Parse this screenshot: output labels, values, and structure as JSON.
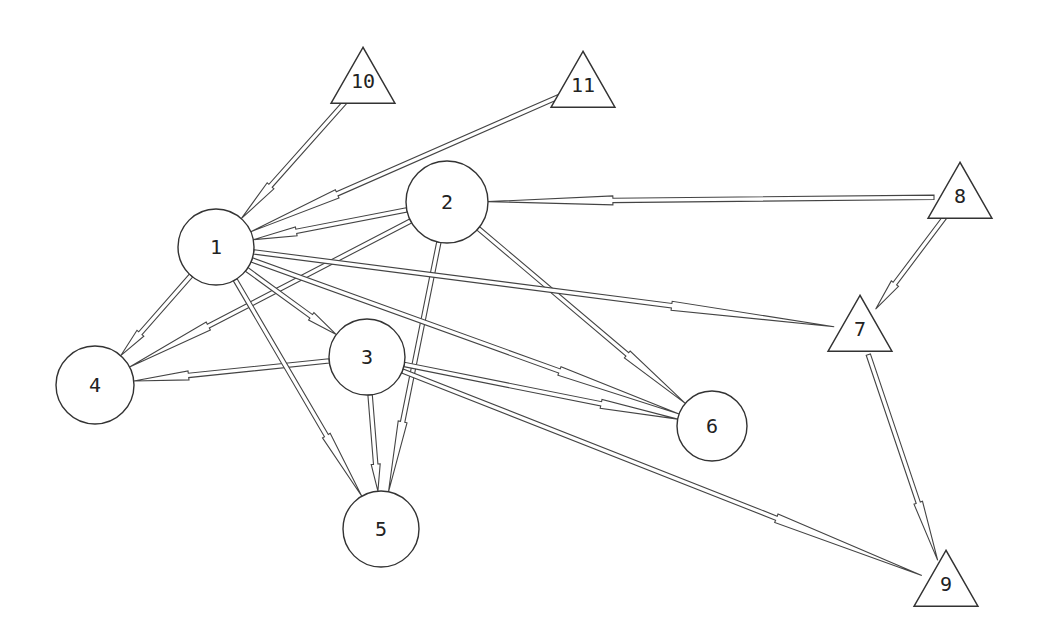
{
  "diagram": {
    "type": "directed-network",
    "nodes": [
      {
        "id": "1",
        "label": "1",
        "shape": "circle",
        "x": 216,
        "y": 247,
        "r": 38
      },
      {
        "id": "2",
        "label": "2",
        "shape": "circle",
        "x": 447,
        "y": 202,
        "r": 41
      },
      {
        "id": "3",
        "label": "3",
        "shape": "circle",
        "x": 367,
        "y": 357,
        "r": 38
      },
      {
        "id": "4",
        "label": "4",
        "shape": "circle",
        "x": 95,
        "y": 385,
        "r": 39
      },
      {
        "id": "5",
        "label": "5",
        "shape": "circle",
        "x": 381,
        "y": 529,
        "r": 38
      },
      {
        "id": "6",
        "label": "6",
        "shape": "circle",
        "x": 712,
        "y": 426,
        "r": 35
      },
      {
        "id": "7",
        "label": "7",
        "shape": "triangle",
        "x": 860,
        "y": 330
      },
      {
        "id": "8",
        "label": "8",
        "shape": "triangle",
        "x": 960,
        "y": 197
      },
      {
        "id": "9",
        "label": "9",
        "shape": "triangle",
        "x": 946,
        "y": 585
      },
      {
        "id": "10",
        "label": "10",
        "shape": "triangle",
        "x": 363,
        "y": 82
      },
      {
        "id": "11",
        "label": "11",
        "shape": "triangle",
        "x": 583,
        "y": 86
      }
    ],
    "edges": [
      {
        "from": "10",
        "to": "1"
      },
      {
        "from": "11",
        "to": "1"
      },
      {
        "from": "2",
        "to": "1"
      },
      {
        "from": "8",
        "to": "2"
      },
      {
        "from": "1",
        "to": "4"
      },
      {
        "from": "2",
        "to": "4"
      },
      {
        "from": "3",
        "to": "4"
      },
      {
        "from": "1",
        "to": "3"
      },
      {
        "from": "1",
        "to": "5"
      },
      {
        "from": "3",
        "to": "5"
      },
      {
        "from": "2",
        "to": "5"
      },
      {
        "from": "1",
        "to": "6"
      },
      {
        "from": "2",
        "to": "6"
      },
      {
        "from": "3",
        "to": "6"
      },
      {
        "from": "1",
        "to": "7"
      },
      {
        "from": "8",
        "to": "7"
      },
      {
        "from": "3",
        "to": "9"
      },
      {
        "from": "7",
        "to": "9"
      }
    ]
  }
}
